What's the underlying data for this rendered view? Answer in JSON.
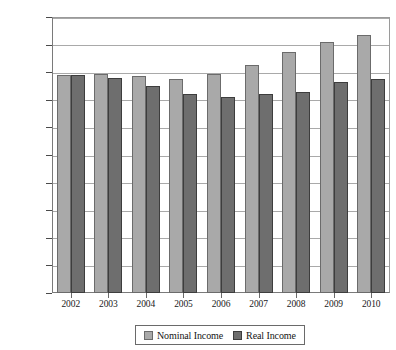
{
  "chart_data": {
    "type": "bar",
    "title": "",
    "subtitle": "",
    "xlabel": "",
    "ylabel": "",
    "categories": [
      "2002",
      "2003",
      "2004",
      "2005",
      "2006",
      "2007",
      "2008",
      "2009",
      "2010"
    ],
    "series": [
      {
        "name": "Nominal Income",
        "color": "#a9a9a9",
        "values": [
          158000,
          159000,
          157000,
          155000,
          159000,
          165000,
          175000,
          182000,
          187000
        ]
      },
      {
        "name": "Real Income",
        "color": "#6e6e6e",
        "values": [
          158000,
          156000,
          150000,
          144000,
          142000,
          144000,
          146000,
          153000,
          155000
        ]
      }
    ],
    "ylim": [
      0,
      200000
    ],
    "ytick_values": [
      0,
      20000,
      40000,
      60000,
      80000,
      100000,
      120000,
      140000,
      160000,
      180000,
      200000
    ],
    "ytick_labels": [
      "$0",
      "$20,000",
      "$40,000",
      "$60,000",
      "$80,000",
      "$100,000",
      "$120,000",
      "$140,000",
      "$160,000",
      "$180,000",
      "$200,000"
    ],
    "grid": true,
    "legend_position": "bottom",
    "legend_entries": [
      "Nominal Income",
      "Real Income"
    ]
  }
}
